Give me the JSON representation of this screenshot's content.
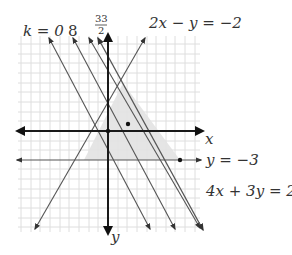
{
  "diagram": {
    "title": "",
    "axes": {
      "x_label": "x",
      "y_label": "y"
    },
    "labels": {
      "k0": "k = 0",
      "k8": "8",
      "k_frac_num": "33",
      "k_frac_den": "2",
      "constraint_top": "2x − y = −2",
      "constraint_y": "y = −3",
      "constraint_right": "4x + 3y = 21"
    },
    "feasible_region": {
      "vertices": [
        [
          1.5,
          5
        ],
        [
          -2.5,
          -3
        ],
        [
          7.5,
          -3
        ]
      ],
      "fill": "#e4e4e4"
    },
    "points": [
      [
        0,
        0
      ],
      [
        2,
        1
      ],
      [
        7.5,
        -3
      ]
    ],
    "colors": {
      "line": "#444444",
      "axis": "#222222",
      "grid": "#dcdcdc",
      "shade": "#e4e4e4"
    }
  }
}
